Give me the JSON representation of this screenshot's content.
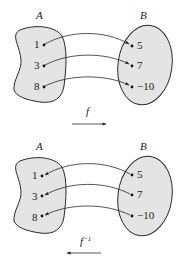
{
  "diagrams": [
    {
      "set_a_label": "A",
      "set_b_label": "B",
      "a_values": [
        "1",
        "3",
        "8"
      ],
      "b_values": [
        "5",
        "7",
        "−10"
      ],
      "function_label": "f",
      "function_superscript": "",
      "direction": "A-to-B"
    },
    {
      "set_a_label": "A",
      "set_b_label": "B",
      "a_values": [
        "1",
        "3",
        "8"
      ],
      "b_values": [
        "5",
        "7",
        "−10"
      ],
      "function_label": "f",
      "function_superscript": "−1",
      "direction": "B-to-A"
    }
  ],
  "colors": {
    "fill": "#e4e4e4",
    "stroke": "#2a2a2a"
  }
}
